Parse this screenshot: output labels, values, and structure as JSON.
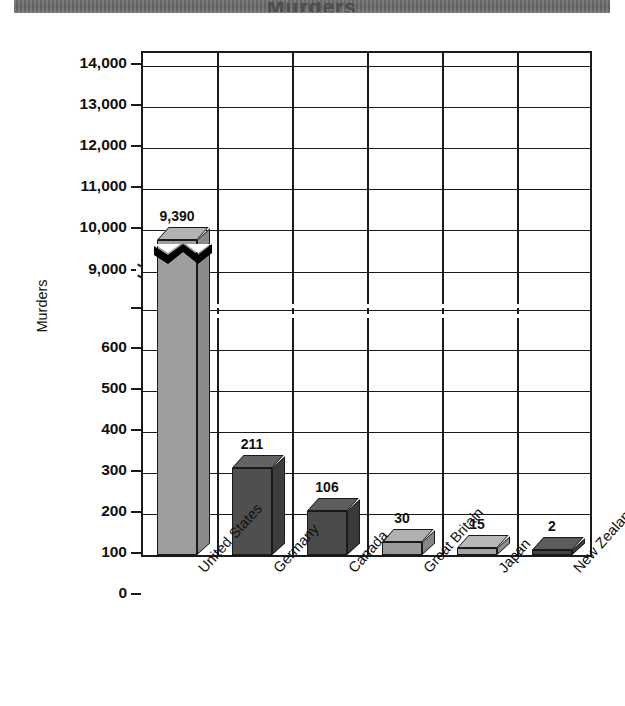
{
  "title_band": {
    "title": "Murders",
    "note": "title text cropped at top edge"
  },
  "chart_data": {
    "type": "bar",
    "title": "",
    "xlabel": "",
    "ylabel": "Murders",
    "categories": [
      "United States",
      "Germany",
      "Canada",
      "Great Britain",
      "Japan",
      "New Zealand"
    ],
    "values": [
      9390,
      211,
      106,
      30,
      15,
      2
    ],
    "value_labels": [
      "9,390",
      "211",
      "106",
      "30",
      "15",
      "2"
    ],
    "bar_shades": [
      "light",
      "dark",
      "dark",
      "light",
      "light",
      "dark"
    ],
    "bar_colors": [
      "#9d9d9d",
      "#4f4f4f",
      "#4a4a4a",
      "#9a9a9a",
      "#a3a3a3",
      "#4d4d4d"
    ],
    "axis_break": true,
    "axis_break_note": "y axis is broken between 600 and 9,000",
    "lower_ticks": [
      0,
      100,
      200,
      300,
      400,
      500,
      600
    ],
    "lower_tick_labels": [
      "0",
      "100",
      "200",
      "300",
      "400",
      "500",
      "600"
    ],
    "upper_ticks": [
      9000,
      10000,
      11000,
      12000,
      13000,
      14000
    ],
    "upper_tick_labels": [
      "9,000",
      "10,000",
      "11,000",
      "12,000",
      "13,000",
      "14,000"
    ],
    "ylim_lower": [
      0,
      600
    ],
    "ylim_upper": [
      9000,
      14000
    ],
    "grid": true,
    "grid_note": "horizontal rules at each labeled tick; vertical rules separating the six categories",
    "legend": null,
    "legend_position": "none",
    "style": "3D isometric bars, halftone grey fills, black outlines"
  },
  "y_axis": {
    "title": "Murders",
    "ticks": [
      {
        "label": "14,000",
        "y": 13
      },
      {
        "label": "13,000",
        "y": 54
      },
      {
        "label": "12,000",
        "y": 95
      },
      {
        "label": "11,000",
        "y": 136
      },
      {
        "label": "10,000",
        "y": 177
      },
      {
        "label": "9,000",
        "y": 219
      },
      {
        "label": "",
        "y": 257
      },
      {
        "label": "600",
        "y": 297
      },
      {
        "label": "500",
        "y": 338
      },
      {
        "label": "400",
        "y": 379
      },
      {
        "label": "300",
        "y": 420
      },
      {
        "label": "200",
        "y": 461
      },
      {
        "label": "100",
        "y": 502
      },
      {
        "label": "0",
        "y": 543
      }
    ]
  },
  "x_axis": {
    "labels": [
      "United States",
      "Germany",
      "Canada",
      "Great Britain",
      "Japan",
      "New Zealand"
    ]
  },
  "bars": [
    {
      "name": "united-states",
      "label": "United States",
      "value": "9,390",
      "color": "#9d9d9d",
      "top": "#b3b3b3",
      "side": "#8a8a8a",
      "x": 14,
      "w": 40,
      "h": 315,
      "cut": true
    },
    {
      "name": "germany",
      "label": "Germany",
      "value": "211",
      "color": "#4f4f4f",
      "top": "#636363",
      "side": "#3d3d3d",
      "x": 89,
      "w": 40,
      "h": 87,
      "cut": false
    },
    {
      "name": "canada",
      "label": "Canada",
      "value": "106",
      "color": "#4a4a4a",
      "top": "#5e5e5e",
      "side": "#3a3a3a",
      "x": 164,
      "w": 40,
      "h": 44,
      "cut": false
    },
    {
      "name": "great-britain",
      "label": "Great Britain",
      "value": "30",
      "color": "#9a9a9a",
      "top": "#b0b0b0",
      "side": "#868686",
      "x": 239,
      "w": 40,
      "h": 13,
      "cut": false
    },
    {
      "name": "japan",
      "label": "Japan",
      "value": "15",
      "color": "#a3a3a3",
      "top": "#b8b8b8",
      "side": "#8e8e8e",
      "x": 314,
      "w": 40,
      "h": 7,
      "cut": false
    },
    {
      "name": "new-zealand",
      "label": "New Zealand",
      "value": "2",
      "color": "#4d3d3d",
      "top": "#5c5c5c",
      "side": "#3b3b3b",
      "x": 389,
      "w": 40,
      "h": 5,
      "cut": false
    }
  ],
  "colors": {
    "ink": "#1a1a1a",
    "paper": "#ffffff",
    "banner": "#6a6a6a",
    "light_bar": "#9d9d9d",
    "dark_bar": "#4c4c4c"
  }
}
